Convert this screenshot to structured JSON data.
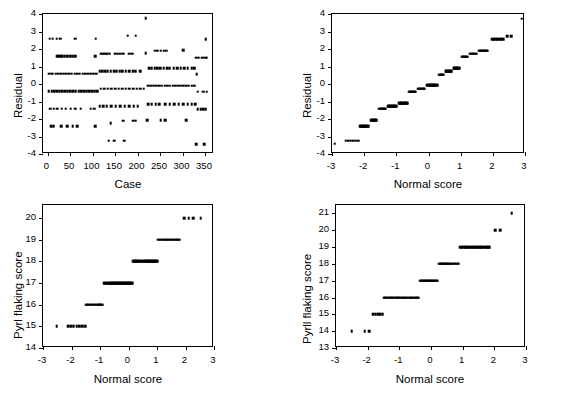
{
  "figure": {
    "background": "#ffffff",
    "ink": "#000000",
    "partial_top_text": "",
    "panel_count": 4
  },
  "chart_data": [
    {
      "id": "residual-vs-case",
      "position": "top-left",
      "type": "scatter",
      "title": "",
      "xlabel": "Case",
      "ylabel": "Residual",
      "xlim": [
        -10,
        370
      ],
      "ylim": [
        -4,
        4
      ],
      "xticks": [
        0,
        50,
        100,
        150,
        200,
        250,
        300,
        350
      ],
      "xticklabels": [
        "0",
        "50",
        "100",
        "150",
        "200",
        "250",
        "300",
        "350"
      ],
      "yticks": [
        -4,
        -3,
        -2,
        -1,
        0,
        1,
        2,
        3,
        4
      ],
      "yticklabels": [
        "-4",
        "-3",
        "-2",
        "-1",
        "0",
        "1",
        "2",
        "3",
        "4"
      ],
      "grid": false,
      "legend": "none",
      "marker": "square",
      "points": [
        [
          5,
          2.6
        ],
        [
          12,
          2.6
        ],
        [
          20,
          2.6
        ],
        [
          28,
          2.6
        ],
        [
          62,
          2.6
        ],
        [
          107,
          2.6
        ],
        [
          352,
          2.55
        ],
        [
          218,
          3.75
        ],
        [
          178,
          2.75
        ],
        [
          196,
          2.75
        ],
        [
          22,
          1.58
        ],
        [
          26,
          1.58
        ],
        [
          30,
          1.58
        ],
        [
          34,
          1.58
        ],
        [
          38,
          1.58
        ],
        [
          44,
          1.58
        ],
        [
          50,
          1.58
        ],
        [
          56,
          1.58
        ],
        [
          62,
          1.58
        ],
        [
          106,
          1.6
        ],
        [
          118,
          1.72
        ],
        [
          122,
          1.72
        ],
        [
          126,
          1.72
        ],
        [
          130,
          1.72
        ],
        [
          134,
          1.72
        ],
        [
          138,
          1.72
        ],
        [
          150,
          1.72
        ],
        [
          156,
          1.72
        ],
        [
          162,
          1.72
        ],
        [
          168,
          1.72
        ],
        [
          182,
          1.72
        ],
        [
          188,
          1.72
        ],
        [
          218,
          1.75
        ],
        [
          238,
          1.9
        ],
        [
          244,
          1.9
        ],
        [
          252,
          1.9
        ],
        [
          258,
          1.9
        ],
        [
          264,
          1.9
        ],
        [
          302,
          1.92
        ],
        [
          330,
          1.5
        ],
        [
          336,
          1.5
        ],
        [
          344,
          1.5
        ],
        [
          350,
          1.5
        ],
        [
          354,
          1.5
        ],
        [
          4,
          0.6
        ],
        [
          10,
          0.6
        ],
        [
          18,
          0.6
        ],
        [
          24,
          0.6
        ],
        [
          30,
          0.6
        ],
        [
          36,
          0.6
        ],
        [
          42,
          0.6
        ],
        [
          48,
          0.6
        ],
        [
          54,
          0.6
        ],
        [
          60,
          0.6
        ],
        [
          66,
          0.6
        ],
        [
          72,
          0.6
        ],
        [
          78,
          0.6
        ],
        [
          84,
          0.6
        ],
        [
          90,
          0.6
        ],
        [
          96,
          0.6
        ],
        [
          102,
          0.6
        ],
        [
          108,
          0.6
        ],
        [
          116,
          0.72
        ],
        [
          122,
          0.72
        ],
        [
          128,
          0.72
        ],
        [
          134,
          0.72
        ],
        [
          140,
          0.72
        ],
        [
          148,
          0.72
        ],
        [
          154,
          0.72
        ],
        [
          160,
          0.72
        ],
        [
          166,
          0.72
        ],
        [
          174,
          0.72
        ],
        [
          182,
          0.72
        ],
        [
          190,
          0.72
        ],
        [
          196,
          0.72
        ],
        [
          206,
          0.72
        ],
        [
          226,
          0.9
        ],
        [
          232,
          0.9
        ],
        [
          238,
          0.9
        ],
        [
          244,
          0.9
        ],
        [
          250,
          0.9
        ],
        [
          258,
          0.9
        ],
        [
          266,
          0.9
        ],
        [
          272,
          0.9
        ],
        [
          280,
          0.9
        ],
        [
          288,
          0.9
        ],
        [
          296,
          0.9
        ],
        [
          304,
          0.9
        ],
        [
          312,
          0.9
        ],
        [
          320,
          0.9
        ],
        [
          326,
          0.9
        ],
        [
          332,
          0.55
        ],
        [
          3,
          -0.4
        ],
        [
          9,
          -0.4
        ],
        [
          15,
          -0.4
        ],
        [
          21,
          -0.4
        ],
        [
          27,
          -0.4
        ],
        [
          33,
          -0.4
        ],
        [
          39,
          -0.4
        ],
        [
          45,
          -0.4
        ],
        [
          51,
          -0.4
        ],
        [
          57,
          -0.4
        ],
        [
          63,
          -0.4
        ],
        [
          69,
          -0.4
        ],
        [
          75,
          -0.4
        ],
        [
          81,
          -0.4
        ],
        [
          87,
          -0.4
        ],
        [
          93,
          -0.4
        ],
        [
          99,
          -0.4
        ],
        [
          105,
          -0.4
        ],
        [
          111,
          -0.4
        ],
        [
          118,
          -0.28
        ],
        [
          126,
          -0.28
        ],
        [
          134,
          -0.28
        ],
        [
          142,
          -0.28
        ],
        [
          150,
          -0.28
        ],
        [
          158,
          -0.28
        ],
        [
          166,
          -0.28
        ],
        [
          174,
          -0.28
        ],
        [
          182,
          -0.28
        ],
        [
          190,
          -0.28
        ],
        [
          198,
          -0.28
        ],
        [
          206,
          -0.28
        ],
        [
          214,
          -0.28
        ],
        [
          224,
          -0.1
        ],
        [
          230,
          -0.1
        ],
        [
          236,
          -0.1
        ],
        [
          242,
          -0.1
        ],
        [
          248,
          -0.1
        ],
        [
          254,
          -0.1
        ],
        [
          260,
          -0.1
        ],
        [
          266,
          -0.1
        ],
        [
          272,
          -0.1
        ],
        [
          278,
          -0.1
        ],
        [
          284,
          -0.1
        ],
        [
          290,
          -0.1
        ],
        [
          296,
          -0.1
        ],
        [
          302,
          -0.1
        ],
        [
          308,
          -0.1
        ],
        [
          314,
          -0.1
        ],
        [
          320,
          -0.1
        ],
        [
          326,
          -0.1
        ],
        [
          334,
          -0.45
        ],
        [
          346,
          -0.45
        ],
        [
          354,
          -0.45
        ],
        [
          6,
          -1.42
        ],
        [
          14,
          -1.42
        ],
        [
          22,
          -1.42
        ],
        [
          32,
          -1.42
        ],
        [
          40,
          -1.42
        ],
        [
          52,
          -1.42
        ],
        [
          62,
          -1.42
        ],
        [
          74,
          -1.42
        ],
        [
          96,
          -1.42
        ],
        [
          104,
          -1.42
        ],
        [
          116,
          -1.28
        ],
        [
          124,
          -1.28
        ],
        [
          132,
          -1.28
        ],
        [
          142,
          -1.28
        ],
        [
          152,
          -1.28
        ],
        [
          162,
          -1.28
        ],
        [
          172,
          -1.28
        ],
        [
          182,
          -1.28
        ],
        [
          192,
          -1.28
        ],
        [
          200,
          -1.28
        ],
        [
          224,
          -1.15
        ],
        [
          232,
          -1.15
        ],
        [
          240,
          -1.15
        ],
        [
          248,
          -1.15
        ],
        [
          262,
          -1.15
        ],
        [
          272,
          -1.15
        ],
        [
          282,
          -1.15
        ],
        [
          292,
          -1.15
        ],
        [
          302,
          -1.15
        ],
        [
          312,
          -1.15
        ],
        [
          320,
          -1.15
        ],
        [
          328,
          -1.15
        ],
        [
          334,
          -1.45
        ],
        [
          340,
          -1.45
        ],
        [
          346,
          -1.45
        ],
        [
          352,
          -1.45
        ],
        [
          8,
          -2.4
        ],
        [
          14,
          -2.4
        ],
        [
          30,
          -2.4
        ],
        [
          44,
          -2.4
        ],
        [
          56,
          -2.4
        ],
        [
          66,
          -2.4
        ],
        [
          106,
          -2.4
        ],
        [
          140,
          -2.25
        ],
        [
          168,
          -2.1
        ],
        [
          190,
          -2.1
        ],
        [
          196,
          -2.1
        ],
        [
          222,
          -2.08
        ],
        [
          252,
          -2.08
        ],
        [
          262,
          -2.08
        ],
        [
          308,
          -2.08
        ],
        [
          136,
          -3.25
        ],
        [
          148,
          -3.25
        ],
        [
          170,
          -3.25
        ],
        [
          330,
          -3.45
        ],
        [
          348,
          -3.45
        ]
      ]
    },
    {
      "id": "residual-normal-plot",
      "position": "top-right",
      "type": "scatter",
      "title": "",
      "xlabel": "Normal score",
      "ylabel": "Residual",
      "xlim": [
        -3,
        3
      ],
      "ylim": [
        -4,
        4
      ],
      "xticks": [
        -3,
        -2,
        -1,
        0,
        1,
        2,
        3
      ],
      "xticklabels": [
        "-3",
        "-2",
        "-1",
        "0",
        "1",
        "2",
        "3"
      ],
      "yticks": [
        -4,
        -3,
        -2,
        -1,
        0,
        1,
        2,
        3,
        4
      ],
      "yticklabels": [
        "-4",
        "-3",
        "-2",
        "-1",
        "0",
        "1",
        "2",
        "3",
        "4"
      ],
      "grid": false,
      "legend": "none",
      "marker": "square",
      "steps": [
        {
          "y": -3.4,
          "x0": -2.92,
          "x1": -2.92,
          "n": 1
        },
        {
          "y": -3.25,
          "x0": -2.58,
          "x1": -2.18,
          "n": 6
        },
        {
          "y": -2.4,
          "x0": -2.12,
          "x1": -1.86,
          "n": 10
        },
        {
          "y": -2.08,
          "x0": -1.8,
          "x1": -1.62,
          "n": 7
        },
        {
          "y": -1.42,
          "x0": -1.54,
          "x1": -1.33,
          "n": 9
        },
        {
          "y": -1.28,
          "x0": -1.26,
          "x1": -1.0,
          "n": 11
        },
        {
          "y": -1.1,
          "x0": -0.92,
          "x1": -0.66,
          "n": 11
        },
        {
          "y": -0.44,
          "x0": -0.6,
          "x1": -0.4,
          "n": 9
        },
        {
          "y": -0.26,
          "x0": -0.33,
          "x1": -0.12,
          "n": 9
        },
        {
          "y": -0.08,
          "x0": -0.05,
          "x1": 0.28,
          "n": 13
        },
        {
          "y": 0.54,
          "x0": 0.33,
          "x1": 0.47,
          "n": 7
        },
        {
          "y": 0.72,
          "x0": 0.53,
          "x1": 0.72,
          "n": 8
        },
        {
          "y": 0.9,
          "x0": 0.78,
          "x1": 0.95,
          "n": 8
        },
        {
          "y": 1.56,
          "x0": 1.03,
          "x1": 1.2,
          "n": 7
        },
        {
          "y": 1.72,
          "x0": 1.28,
          "x1": 1.5,
          "n": 8
        },
        {
          "y": 1.9,
          "x0": 1.57,
          "x1": 1.82,
          "n": 9
        },
        {
          "y": 2.55,
          "x0": 1.98,
          "x1": 2.32,
          "n": 8
        },
        {
          "y": 2.72,
          "x0": 2.45,
          "x1": 2.58,
          "n": 2
        },
        {
          "y": 3.72,
          "x0": 2.9,
          "x1": 2.9,
          "n": 1
        }
      ]
    },
    {
      "id": "pyrl-flaking-normal-plot-a",
      "position": "bottom-left",
      "type": "scatter",
      "title": "",
      "xlabel": "Normal score",
      "ylabel": "Pyrl flaking score",
      "xlim": [
        -3,
        3
      ],
      "ylim": [
        14,
        20.6
      ],
      "xticks": [
        -3,
        -2,
        -1,
        0,
        1,
        2,
        3
      ],
      "xticklabels": [
        "-3",
        "-2",
        "-1",
        "0",
        "1",
        "2",
        "3"
      ],
      "yticks": [
        14,
        15,
        16,
        17,
        18,
        19,
        20
      ],
      "yticklabels": [
        "14",
        "15",
        "16",
        "17",
        "18",
        "19",
        "20"
      ],
      "grid": false,
      "legend": "none",
      "marker": "square",
      "steps": [
        {
          "y": 15,
          "x0": -2.52,
          "x1": -2.52,
          "n": 1
        },
        {
          "y": 15,
          "x0": -2.12,
          "x1": -1.52,
          "n": 7
        },
        {
          "y": 16,
          "x0": -1.48,
          "x1": -0.92,
          "n": 16
        },
        {
          "y": 17,
          "x0": -0.87,
          "x1": 0.12,
          "n": 30
        },
        {
          "y": 18,
          "x0": 0.16,
          "x1": 1.0,
          "n": 26
        },
        {
          "y": 19,
          "x0": 1.05,
          "x1": 1.8,
          "n": 16
        },
        {
          "y": 20,
          "x0": 1.95,
          "x1": 2.28,
          "n": 3
        },
        {
          "y": 20,
          "x0": 2.54,
          "x1": 2.54,
          "n": 1
        }
      ]
    },
    {
      "id": "pyrl-flaking-normal-plot-b",
      "position": "bottom-right",
      "type": "scatter",
      "title": "",
      "xlabel": "Normal score",
      "ylabel": "Pyrll flaking score",
      "xlim": [
        -3,
        3
      ],
      "ylim": [
        13,
        21.5
      ],
      "xticks": [
        -3,
        -2,
        -1,
        0,
        1,
        2,
        3
      ],
      "xticklabels": [
        "-3",
        "-2",
        "-1",
        "0",
        "1",
        "2",
        "3"
      ],
      "yticks": [
        13,
        14,
        15,
        16,
        17,
        18,
        19,
        20,
        21
      ],
      "yticklabels": [
        "13",
        "14",
        "15",
        "16",
        "17",
        "18",
        "19",
        "20",
        "21"
      ],
      "grid": false,
      "legend": "none",
      "marker": "square",
      "steps": [
        {
          "y": 14,
          "x0": -2.5,
          "x1": -2.5,
          "n": 1
        },
        {
          "y": 14,
          "x0": -2.1,
          "x1": -1.95,
          "n": 2
        },
        {
          "y": 15,
          "x0": -1.82,
          "x1": -1.52,
          "n": 5
        },
        {
          "y": 16,
          "x0": -1.48,
          "x1": -0.4,
          "n": 30
        },
        {
          "y": 17,
          "x0": -0.34,
          "x1": 0.2,
          "n": 18
        },
        {
          "y": 18,
          "x0": 0.25,
          "x1": 0.88,
          "n": 20
        },
        {
          "y": 19,
          "x0": 0.93,
          "x1": 1.86,
          "n": 22
        },
        {
          "y": 20,
          "x0": 2.02,
          "x1": 2.18,
          "n": 2
        },
        {
          "y": 21,
          "x0": 2.55,
          "x1": 2.55,
          "n": 1
        }
      ]
    }
  ]
}
